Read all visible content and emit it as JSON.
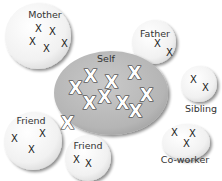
{
  "diagram": {
    "center": {
      "label": "Self",
      "marks": [
        "X",
        "X",
        "X",
        "X",
        "X",
        "X",
        "X",
        "X",
        "X",
        "X"
      ]
    },
    "groups": [
      {
        "label": "Mother",
        "marks": [
          "X",
          "X",
          "X",
          "X",
          "X"
        ]
      },
      {
        "label": "Father",
        "marks": [
          "X",
          "X"
        ]
      },
      {
        "label": "Sibling",
        "marks": [
          "X",
          "X"
        ]
      },
      {
        "label": "Friend",
        "marks": [
          "X",
          "X",
          "X"
        ]
      },
      {
        "label": "Friend",
        "marks": [
          "X",
          "X"
        ]
      },
      {
        "label": "Co-worker",
        "marks": [
          "X",
          "X",
          "X"
        ]
      }
    ],
    "colors": {
      "self_fill": "#b9b9b9",
      "group_fill": "#f2f2f2",
      "shadow": "#9a9a9a",
      "text": "#333333"
    }
  }
}
